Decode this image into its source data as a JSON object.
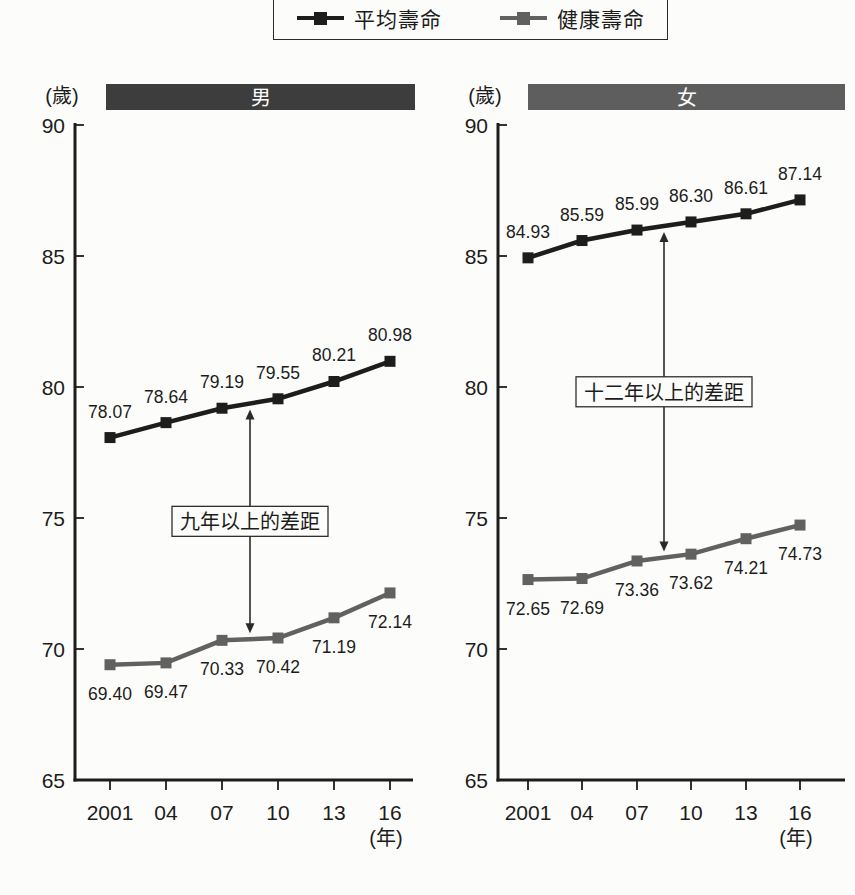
{
  "figure": {
    "background": "#fcfcfa",
    "axis_color": "#1c1c1c"
  },
  "legend": {
    "items": [
      {
        "label": "平均壽命",
        "color": "#1d1d1d"
      },
      {
        "label": "健康壽命",
        "color": "#616161"
      }
    ]
  },
  "chart_data": [
    {
      "type": "line",
      "title": "男",
      "title_bg": "#3d3d3d",
      "y_unit_label": "(歲)",
      "x_unit_label": "(年)",
      "categories": [
        "2001",
        "04",
        "07",
        "10",
        "13",
        "16"
      ],
      "ylim": [
        65,
        90
      ],
      "yticks": [
        90,
        85,
        80,
        75,
        70,
        65
      ],
      "grid": false,
      "series": [
        {
          "name": "平均壽命",
          "color": "#1d1d1d",
          "label_position": "above",
          "values": [
            78.07,
            78.64,
            79.19,
            79.55,
            80.21,
            80.98
          ]
        },
        {
          "name": "健康壽命",
          "color": "#616161",
          "label_position": "below",
          "values": [
            69.4,
            69.47,
            70.33,
            70.42,
            71.19,
            72.14
          ]
        }
      ],
      "annotation": {
        "text": "九年以上的差距"
      }
    },
    {
      "type": "line",
      "title": "女",
      "title_bg": "#5e5e5e",
      "y_unit_label": "(歲)",
      "x_unit_label": "(年)",
      "categories": [
        "2001",
        "04",
        "07",
        "10",
        "13",
        "16"
      ],
      "ylim": [
        65,
        90
      ],
      "yticks": [
        90,
        85,
        80,
        75,
        70,
        65
      ],
      "grid": false,
      "series": [
        {
          "name": "平均壽命",
          "color": "#1d1d1d",
          "label_position": "above",
          "values": [
            84.93,
            85.59,
            85.99,
            86.3,
            86.61,
            87.14
          ]
        },
        {
          "name": "健康壽命",
          "color": "#616161",
          "label_position": "below",
          "values": [
            72.65,
            72.69,
            73.36,
            73.62,
            74.21,
            74.73
          ]
        }
      ],
      "annotation": {
        "text": "十二年以上的差距"
      }
    }
  ]
}
